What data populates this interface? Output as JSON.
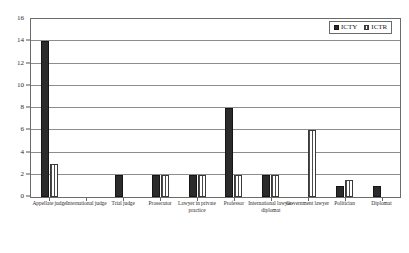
{
  "chart_data": {
    "type": "bar",
    "title": "",
    "xlabel": "",
    "ylabel": "",
    "ylim": [
      0,
      16
    ],
    "ytick_step": 2,
    "yticks": [
      0,
      2,
      4,
      6,
      8,
      10,
      12,
      14,
      16
    ],
    "ytick_labels": [
      "0",
      "2",
      "4",
      "6",
      "8",
      "10",
      "12",
      "14",
      "16"
    ],
    "grid": true,
    "grid_axis": "y",
    "legend_position": "top-right",
    "categories": [
      "Appellate judge",
      "International judge",
      "Trial judge",
      "Prosecutor",
      "Lawyer in private practice",
      "Professor",
      "International lawyer-diplomat",
      "Government lawyer",
      "Politician",
      "Diplomat"
    ],
    "series": [
      {
        "name": "ICTY",
        "color": "#2b2b2b",
        "values": [
          14,
          0,
          2,
          2,
          2,
          8,
          2,
          0,
          1,
          1
        ]
      },
      {
        "name": "ICTR",
        "color": "#ffffff",
        "pattern": "vertical-stripes",
        "values": [
          3,
          0,
          0,
          2,
          2,
          2,
          2,
          6,
          1.5,
          0
        ]
      }
    ]
  },
  "legend": {
    "items": [
      {
        "label": "ICTY",
        "swatch": "solid-dark-square-icon"
      },
      {
        "label": "ICTR",
        "swatch": "striped-light-square-icon"
      }
    ]
  },
  "axes": {
    "y": {
      "ticks": [
        "16",
        "14",
        "12",
        "10",
        "8",
        "6",
        "4",
        "2",
        "0"
      ]
    },
    "x": {
      "labels": [
        "Appellate judge",
        "International judge",
        "Trial judge",
        "Prosecutor",
        "Lawyer in private practice",
        "Professor",
        "International lawyer-diplomat",
        "Government lawyer",
        "Politician",
        "Diplomat"
      ]
    }
  }
}
